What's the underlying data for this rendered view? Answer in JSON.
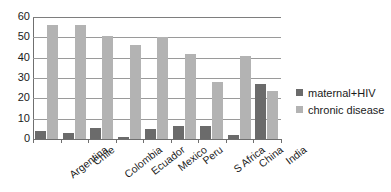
{
  "chart_data": {
    "type": "bar",
    "title": "",
    "xlabel": "",
    "ylabel": "",
    "ylim": [
      0,
      60
    ],
    "yticks": [
      0,
      10,
      20,
      30,
      40,
      50,
      60
    ],
    "grid": true,
    "legend_position": "right",
    "categories": [
      "Argentina",
      "Chile",
      "Colombia",
      "Ecuador",
      "Mexico",
      "Peru",
      "S Africa",
      "China",
      "India"
    ],
    "series": [
      {
        "name": "maternal+HIV",
        "color": "#6b6b6b",
        "values": [
          4,
          3.2,
          5.6,
          0.8,
          5,
          6.3,
          6.4,
          1.8,
          27
        ]
      },
      {
        "name": "chronic disease",
        "color": "#b3b3b3",
        "values": [
          56,
          56,
          50.5,
          46,
          50,
          42,
          28,
          41,
          23.5
        ]
      }
    ]
  },
  "legend": {
    "items": [
      {
        "label": "maternal+HIV",
        "color": "#6b6b6b"
      },
      {
        "label": "chronic disease",
        "color": "#b3b3b3"
      }
    ]
  },
  "axis": {
    "y_tick_labels": [
      "60",
      "50",
      "40",
      "30",
      "20",
      "10",
      "0"
    ]
  }
}
